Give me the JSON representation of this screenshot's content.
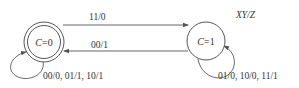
{
  "diagram": {
    "type": "state-machine",
    "legend": "XY/Z",
    "states": [
      {
        "id": "s0",
        "var": "C",
        "value": "=0",
        "accepting": true
      },
      {
        "id": "s1",
        "var": "C",
        "value": "=1",
        "accepting": false
      }
    ],
    "transitions": [
      {
        "from": "s0",
        "to": "s1",
        "label": "11/0"
      },
      {
        "from": "s1",
        "to": "s0",
        "label": "00/1"
      },
      {
        "from": "s0",
        "to": "s0",
        "label": "00/0, 01/1, 10/1"
      },
      {
        "from": "s1",
        "to": "s1",
        "label": "01/0, 10/0, 11/1"
      }
    ]
  }
}
